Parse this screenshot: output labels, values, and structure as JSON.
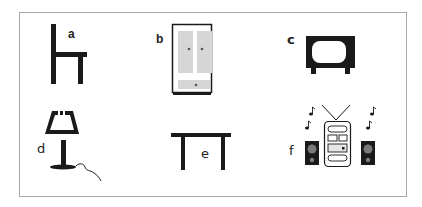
{
  "items": [
    {
      "letter": "a",
      "object": "chair"
    },
    {
      "letter": "b",
      "object": "wardrobe"
    },
    {
      "letter": "c",
      "object": "television"
    },
    {
      "letter": "d",
      "object": "lamp"
    },
    {
      "letter": "e",
      "object": "table"
    },
    {
      "letter": "f",
      "object": "stereo"
    }
  ],
  "colors": {
    "ink": "#1a1a1a",
    "panel_gray": "#d6d6d6",
    "frame_border": "#a8a8a8",
    "speaker_cone": "#7a7a7a"
  }
}
